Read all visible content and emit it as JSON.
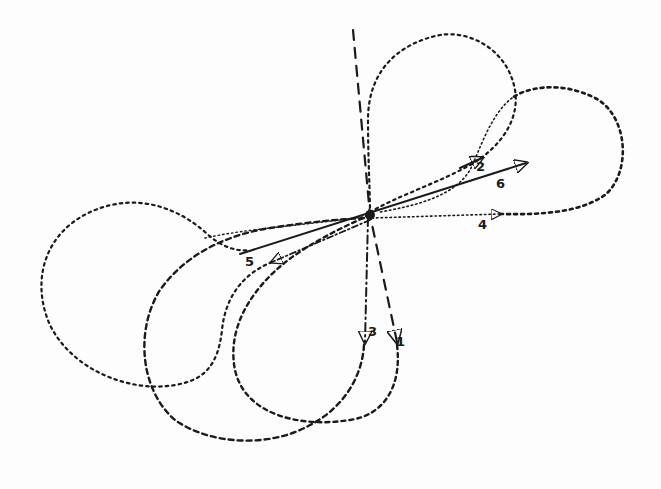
{
  "diagram": {
    "type": "trajectory-loops",
    "origin": {
      "x": 370,
      "y": 215
    },
    "ink_color": "#1a1a1a",
    "background_color": "#fdfdfd",
    "paths": [
      {
        "id": 1,
        "label": "1",
        "style": "long-dash",
        "description": "near-vertical dashed line descending to arrow, then loops left and back up"
      },
      {
        "id": 2,
        "label": "2",
        "style": "dotted",
        "description": "upper loop rising above origin, arrow near label 2"
      },
      {
        "id": 3,
        "label": "3",
        "style": "dash-dot",
        "description": "vertical dash-dot line down to arrow, loops into lower-left circle"
      },
      {
        "id": 4,
        "label": "4",
        "style": "dotted",
        "description": "horizontal dotted line right to arrow, continues into large right loop"
      },
      {
        "id": 5,
        "label": "5",
        "style": "dash-dot",
        "description": "line toward lower-left with arrow, continues into left circular loop"
      },
      {
        "id": 6,
        "label": "6",
        "style": "solid",
        "description": "solid straight line from lower-left through origin to arrow at upper right"
      }
    ]
  },
  "labels": {
    "l1": "1",
    "l2": "2",
    "l3": "3",
    "l4": "4",
    "l5": "5",
    "l6": "6"
  }
}
